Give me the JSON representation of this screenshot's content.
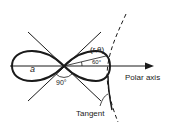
{
  "diagram": {
    "type": "lemniscate-with-tangent",
    "labels": {
      "a": "a",
      "angle_center": "90°",
      "point": "(r,θ)",
      "angle_point": "60°",
      "polar_axis": "Polar axis",
      "tangent": "Tangent"
    },
    "colors": {
      "stroke": "#1a1a1a",
      "background": "#ffffff"
    }
  }
}
